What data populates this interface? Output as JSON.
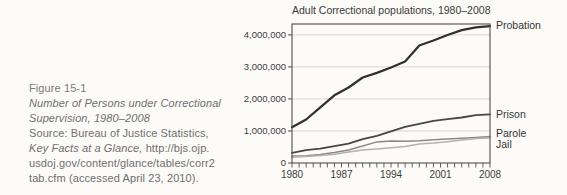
{
  "caption": {
    "figure_label": "Figure 15-1",
    "title_line1": "Number of Persons under Correctional",
    "title_line2": "Supervision, 1980–2008",
    "source_line1": "Source: Bureau of Justice Statistics,",
    "source_italic_part": "Key Facts at a Glance,",
    "source_url_part": "http://bjs.ojp.",
    "source_line3": "usdoj.gov/content/glance/tables/corr2",
    "source_line4": "tab.cfm (accessed April 23, 2010)."
  },
  "chart_data": {
    "type": "line",
    "title": "Adult Correctional populations, 1980–2008",
    "xlabel": "",
    "ylabel": "",
    "xlim": [
      1980,
      2008
    ],
    "ylim": [
      0,
      4340000
    ],
    "grid": true,
    "minor_x_tick_step": 1,
    "legend_position": "right-of-line-ends",
    "x": [
      1980,
      1982,
      1984,
      1986,
      1988,
      1990,
      1992,
      1994,
      1996,
      1998,
      2000,
      2002,
      2004,
      2006,
      2008
    ],
    "series": [
      {
        "name": "Probation",
        "color": "#303030",
        "stroke_width": 2.2,
        "values": [
          1118000,
          1357000,
          1740000,
          2114000,
          2356000,
          2670000,
          2812000,
          2981000,
          3165000,
          3670000,
          3826000,
          3995000,
          4151000,
          4237000,
          4271000
        ]
      },
      {
        "name": "Prison",
        "color": "#474747",
        "stroke_width": 1.8,
        "values": [
          320000,
          402000,
          448000,
          526000,
          607000,
          743000,
          850000,
          990000,
          1128000,
          1224000,
          1316000,
          1367000,
          1421000,
          1492000,
          1518000
        ]
      },
      {
        "name": "Parole",
        "color": "#8a8a8a",
        "stroke_width": 1.5,
        "values": [
          220000,
          224000,
          266000,
          326000,
          407000,
          531000,
          658000,
          690000,
          680000,
          696000,
          724000,
          750000,
          771000,
          798000,
          828000
        ]
      },
      {
        "name": "Jail",
        "color": "#b2b2b2",
        "stroke_width": 1.5,
        "values": [
          182000,
          207000,
          234000,
          272000,
          341000,
          405000,
          441000,
          479000,
          518000,
          592000,
          621000,
          665000,
          714000,
          766000,
          785000
        ]
      }
    ],
    "yticks": [
      {
        "value": 0,
        "label": "0"
      },
      {
        "value": 1000000,
        "label": "1,000,000"
      },
      {
        "value": 2000000,
        "label": "2,000,000"
      },
      {
        "value": 3000000,
        "label": "3,000,000"
      },
      {
        "value": 4000000,
        "label": "4,000,000"
      }
    ],
    "xticks": [
      {
        "value": 1980,
        "label": "1980"
      },
      {
        "value": 1987,
        "label": "1987"
      },
      {
        "value": 1994,
        "label": "1994"
      },
      {
        "value": 2001,
        "label": "2001"
      },
      {
        "value": 2008,
        "label": "2008"
      }
    ],
    "colors": {
      "grid": "#cbcbcb",
      "axis": "#4f4f4f",
      "text": "#3a3a3a"
    }
  }
}
